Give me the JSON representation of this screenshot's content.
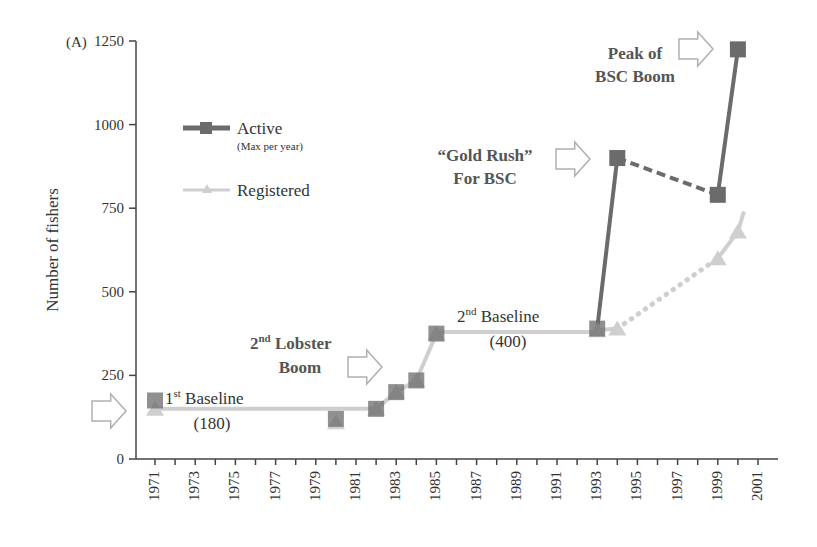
{
  "panel_label": "(A)",
  "colors": {
    "active": "#6b6b6b",
    "registered": "#cfcfcf",
    "axis": "#444444",
    "arrow_stroke": "#b0b0b0"
  },
  "legend": {
    "active_label": "Active",
    "active_sublabel": "(Max per year)",
    "registered_label": "Registered"
  },
  "annotations": {
    "baseline1_title_pre": "1",
    "baseline1_title_sup": "st",
    "baseline1_title_post": " Baseline",
    "baseline1_value": "(180)",
    "lobster_pre": "2",
    "lobster_sup": "nd",
    "lobster_post": " Lobster",
    "lobster_line2": "Boom",
    "baseline2_pre": "2",
    "baseline2_sup": "nd",
    "baseline2_post": " Baseline",
    "baseline2_value": "(400)",
    "goldrush_line1": "“Gold Rush”",
    "goldrush_line2": "For BSC",
    "peak_line1": "Peak of",
    "peak_line2": "BSC Boom"
  },
  "chart_data": {
    "type": "line",
    "title": "",
    "xlabel": "",
    "ylabel": "Number of fishers",
    "ylim": [
      0,
      1250
    ],
    "yticks": [
      0,
      250,
      500,
      750,
      1000,
      1250
    ],
    "xlim": [
      1970,
      2002
    ],
    "xtick_labels": [
      "1971",
      "1973",
      "1975",
      "1977",
      "1979",
      "1981",
      "1983",
      "1985",
      "1987",
      "1989",
      "1991",
      "1993",
      "1995",
      "1997",
      "1999",
      "2001"
    ],
    "grid": false,
    "legend_position": "upper-left inside",
    "series": [
      {
        "name": "Active (Max per year)",
        "marker": "square",
        "points": [
          {
            "x": 1971,
            "y": 175
          },
          {
            "x": 1980,
            "y": 120
          },
          {
            "x": 1982,
            "y": 150
          },
          {
            "x": 1983,
            "y": 200
          },
          {
            "x": 1984,
            "y": 235
          },
          {
            "x": 1985,
            "y": 375
          },
          {
            "x": 1993,
            "y": 390
          },
          {
            "x": 1994,
            "y": 900
          },
          {
            "x": 1999,
            "y": 790
          },
          {
            "x": 2000,
            "y": 1225
          }
        ],
        "segments_note": "solid 1993-1994, dashed 1994-1999, solid 1999-2000"
      },
      {
        "name": "Registered",
        "marker": "triangle",
        "points": [
          {
            "x": 1971,
            "y": 150
          },
          {
            "x": 1980,
            "y": 110
          },
          {
            "x": 1982,
            "y": 150
          },
          {
            "x": 1983,
            "y": 200
          },
          {
            "x": 1984,
            "y": 235
          },
          {
            "x": 1985,
            "y": 375
          },
          {
            "x": 1993,
            "y": 385
          },
          {
            "x": 1994,
            "y": 390
          },
          {
            "x": 1999,
            "y": 600
          },
          {
            "x": 2000,
            "y": 680
          }
        ],
        "baseline_lines": [
          {
            "from": 1971,
            "to": 1982,
            "y": 150,
            "label": "1st Baseline (180)"
          },
          {
            "from": 1985,
            "to": 1993,
            "y": 380,
            "label": "2nd Baseline (400)"
          }
        ],
        "segments_note": "dotted 1994-1999, solid trend 1999-2000.3"
      }
    ],
    "annotations": [
      "1st Baseline (180)",
      "2nd Lobster Boom",
      "2nd Baseline (400)",
      "“Gold Rush” For BSC",
      "Peak of BSC Boom"
    ]
  }
}
